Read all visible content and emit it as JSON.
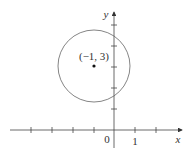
{
  "diagram": {
    "axes": {
      "x_label": "x",
      "y_label": "y",
      "origin_label": "0",
      "x_tick_label": "1"
    },
    "circle": {
      "center_label": "(−1, 3)",
      "center": [
        -1,
        3
      ]
    },
    "colors": {
      "stroke": "#444444",
      "circle": "#666666",
      "background": "#ffffff"
    }
  }
}
